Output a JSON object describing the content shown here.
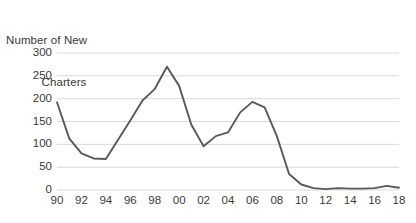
{
  "chart_data": {
    "type": "line",
    "title": "Number of New Charters",
    "title_line1": "Number of New",
    "title_line2": "Charters",
    "xlabel": "",
    "ylabel": "Number of New Charters",
    "ylim": [
      0,
      300
    ],
    "xlim": [
      1990,
      2018
    ],
    "grid": true,
    "grid_axis": "y",
    "legend": false,
    "legend_position": "none",
    "line_color": "#595959",
    "grid_color": "#d9d9d9",
    "y_ticks": [
      0,
      50,
      100,
      150,
      200,
      250,
      300
    ],
    "y_tick_labels": [
      "0",
      "50",
      "100",
      "150",
      "200",
      "250",
      "300"
    ],
    "x_ticks": [
      1990,
      1992,
      1994,
      1996,
      1998,
      2000,
      2002,
      2004,
      2006,
      2008,
      2010,
      2012,
      2014,
      2016,
      2018
    ],
    "x_tick_labels": [
      "90",
      "92",
      "94",
      "96",
      "98",
      "00",
      "02",
      "04",
      "06",
      "08",
      "10",
      "12",
      "14",
      "16",
      "18"
    ],
    "x": [
      1990,
      1991,
      1992,
      1993,
      1994,
      1995,
      1996,
      1997,
      1998,
      1999,
      2000,
      2001,
      2002,
      2003,
      2004,
      2005,
      2006,
      2007,
      2008,
      2009,
      2010,
      2011,
      2012,
      2013,
      2014,
      2015,
      2016,
      2017,
      2018
    ],
    "values": [
      192,
      113,
      80,
      69,
      68,
      110,
      152,
      196,
      221,
      270,
      228,
      143,
      96,
      118,
      126,
      170,
      193,
      181,
      118,
      35,
      12,
      4,
      2,
      4,
      3,
      3,
      4,
      9,
      5
    ],
    "series": [
      {
        "name": "New Charters",
        "values": [
          192,
          113,
          80,
          69,
          68,
          110,
          152,
          196,
          221,
          270,
          228,
          143,
          96,
          118,
          126,
          170,
          193,
          181,
          118,
          35,
          12,
          4,
          2,
          4,
          3,
          3,
          4,
          9,
          5
        ]
      }
    ]
  }
}
